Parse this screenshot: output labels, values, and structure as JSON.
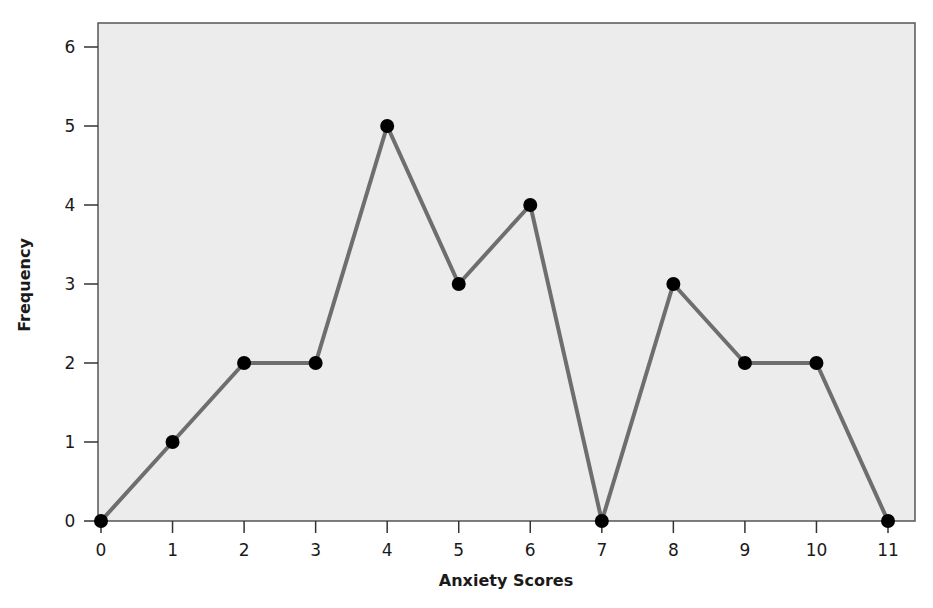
{
  "chart_data": {
    "type": "line",
    "title": "",
    "xlabel": "Anxiety Scores",
    "ylabel": "Frequency",
    "x": [
      0,
      1,
      2,
      3,
      4,
      5,
      6,
      7,
      8,
      9,
      10,
      11
    ],
    "series": [
      {
        "name": "Frequency",
        "values": [
          0,
          1,
          2,
          2,
          5,
          3,
          4,
          0,
          3,
          2,
          2,
          0
        ]
      }
    ],
    "xticks": [
      "0",
      "1",
      "2",
      "3",
      "4",
      "5",
      "6",
      "7",
      "8",
      "9",
      "10",
      "11"
    ],
    "yticks": [
      "0",
      "1",
      "2",
      "3",
      "4",
      "5",
      "6"
    ],
    "xlim": [
      0,
      11
    ],
    "ylim": [
      0,
      6
    ],
    "grid": false,
    "legend": null,
    "markers": "filled-circle"
  },
  "colors": {
    "plot_background": "#ececec",
    "line": "#6e6e6e",
    "marker": "#000000",
    "axis": "#333333",
    "frame": "#555555"
  }
}
